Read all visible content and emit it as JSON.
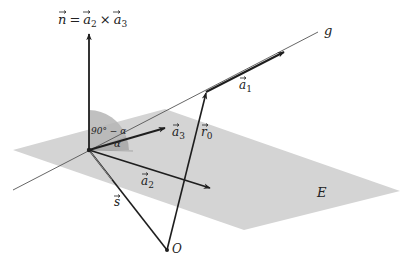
{
  "diagram": {
    "colors": {
      "plane": "#d4d4d4",
      "angle_sector": "#b5b5b5",
      "vector": "#1e1e1e",
      "line_g": "#555555",
      "background": "#ffffff"
    },
    "labels": {
      "normal_vector": "n⃗ = a⃗₂ × a⃗₃",
      "normal_n": "n",
      "normal_eq": "=",
      "normal_a2": "a",
      "normal_a2_sub": "2",
      "normal_times": "×",
      "normal_a3": "a",
      "normal_a3_sub": "3",
      "line": "g",
      "a1": "a",
      "a1_sub": "1",
      "a2": "a",
      "a2_sub": "2",
      "a3": "a",
      "a3_sub": "3",
      "r0": "r",
      "r0_sub": "0",
      "s": "s",
      "origin": "O",
      "plane": "E",
      "angle_complement": "90° − α",
      "angle_alpha": "α"
    },
    "points": {
      "plane_foot": [
        89,
        150
      ],
      "line_point": [
        206,
        92
      ],
      "origin_O": [
        167,
        250
      ]
    },
    "vectors": [
      {
        "name": "n",
        "from": [
          89,
          150
        ],
        "to": [
          89,
          33
        ]
      },
      {
        "name": "a1",
        "from": [
          206,
          92
        ],
        "to": [
          284,
          52
        ]
      },
      {
        "name": "a2",
        "from": [
          89,
          150
        ],
        "to": [
          210,
          188
        ]
      },
      {
        "name": "a3",
        "from": [
          89,
          150
        ],
        "to": [
          165,
          128
        ]
      },
      {
        "name": "r0",
        "from": [
          167,
          250
        ],
        "to": [
          206,
          92
        ]
      },
      {
        "name": "s",
        "from": [
          167,
          250
        ],
        "to": [
          89,
          150
        ]
      }
    ],
    "line_g": {
      "from": [
        13,
        190
      ],
      "to": [
        318,
        32
      ]
    },
    "plane_polygon": [
      [
        13,
        150
      ],
      [
        165,
        109
      ],
      [
        400,
        191
      ],
      [
        244,
        230
      ]
    ]
  }
}
